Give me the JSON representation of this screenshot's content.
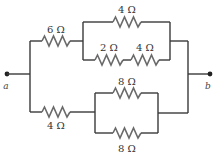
{
  "diagram": {
    "type": "resistor-network",
    "nodes": {
      "a": "a",
      "b": "b"
    },
    "resistors": {
      "r_top_series": "6 Ω",
      "r_top_upper": "4 Ω",
      "r_top_lower_left": "2 Ω",
      "r_top_lower_right": "4 Ω",
      "r_bottom_series": "4 Ω",
      "r_bottom_upper": "8 Ω",
      "r_bottom_lower": "8 Ω"
    },
    "colors": {
      "wire": "#3a3a3a",
      "resistor": "#6a6a6a",
      "text": "#333333"
    }
  }
}
